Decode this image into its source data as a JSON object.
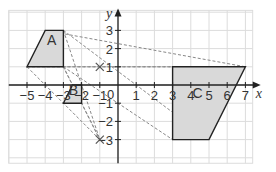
{
  "diagram": {
    "type": "coordinate-grid-enlargement",
    "axes": {
      "x_label": "x",
      "y_label": "y",
      "x_ticks": [
        "−5",
        "−4",
        "−3",
        "−2",
        "−1",
        "1",
        "2",
        "3",
        "4",
        "5",
        "6",
        "7"
      ],
      "y_ticks": [
        "3",
        "2",
        "1",
        "−1",
        "−2",
        "−3"
      ],
      "origin_label": "0",
      "x_range": [
        -6,
        7.4
      ],
      "y_range": [
        -4.3,
        4.1
      ]
    },
    "shapes": [
      {
        "label": "A",
        "vertices": [
          [
            -5,
            1
          ],
          [
            -4,
            3
          ],
          [
            -3,
            3
          ],
          [
            -3,
            1
          ]
        ]
      },
      {
        "label": "B",
        "vertices": [
          [
            -3,
            -1
          ],
          [
            -2.5,
            0
          ],
          [
            -2,
            0
          ],
          [
            -2,
            -1
          ]
        ]
      },
      {
        "label": "C",
        "vertices": [
          [
            3,
            1
          ],
          [
            7,
            1
          ],
          [
            5,
            -3
          ],
          [
            3,
            -3
          ]
        ]
      }
    ],
    "centres": [
      {
        "marker": "×",
        "point": [
          -1,
          1
        ]
      },
      {
        "marker": "×",
        "point": [
          -1,
          -3
        ]
      }
    ],
    "colors": {
      "grid": "#dcdcdc",
      "axis": "#222222",
      "shape_fill": "#d9d9d9",
      "shape_stroke": "#222222",
      "construction": "#888888"
    }
  }
}
